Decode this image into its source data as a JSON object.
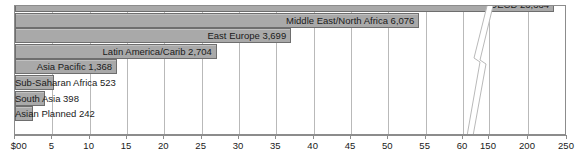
{
  "chart_data": {
    "type": "bar",
    "orientation": "horizontal",
    "title": "",
    "xlabel": "",
    "ylabel": "",
    "grid": true,
    "legend": "none",
    "axis_note": "broken x-axis: linear 0-60, then 150, 200, 250",
    "axis_ticks": [
      {
        "label": "$00",
        "value": 0
      },
      {
        "label": "5",
        "value": 5
      },
      {
        "label": "10",
        "value": 10
      },
      {
        "label": "15",
        "value": 15
      },
      {
        "label": "20",
        "value": 20
      },
      {
        "label": "25",
        "value": 25
      },
      {
        "label": "30",
        "value": 30
      },
      {
        "label": "35",
        "value": 35
      },
      {
        "label": "40",
        "value": 40
      },
      {
        "label": "45",
        "value": 45
      },
      {
        "label": "50",
        "value": 50
      },
      {
        "label": "55",
        "value": 55
      },
      {
        "label": "60",
        "value": 60
      },
      {
        "label": "150",
        "value": 150
      },
      {
        "label": "200",
        "value": 200
      },
      {
        "label": "250",
        "value": 250
      }
    ],
    "categories": [
      "OECD",
      "Middle East/North Africa",
      "East Europe",
      "Latin America/Carib",
      "Asia Pacific",
      "Sub-Saharan Africa",
      "South Asia",
      "Asian Planned"
    ],
    "values": [
      23334,
      6076,
      3699,
      2704,
      1368,
      523,
      398,
      242
    ],
    "bars": [
      {
        "label": "OECD",
        "value_text": "23,334",
        "value": 23334,
        "axis_value": 233.34
      },
      {
        "label": "Middle East/North Africa",
        "value_text": "6,076",
        "value": 6076,
        "axis_value": 60.76
      },
      {
        "label": "East Europe",
        "value_text": "3,699",
        "value": 3699,
        "axis_value": 36.99
      },
      {
        "label": "Latin America/Carib",
        "value_text": "2,704",
        "value": 2704,
        "axis_value": 27.04
      },
      {
        "label": "Asia Pacific",
        "value_text": "1,368",
        "value": 1368,
        "axis_value": 13.68
      },
      {
        "label": "Sub-Saharan Africa",
        "value_text": "523",
        "value": 523,
        "axis_value": 5.23
      },
      {
        "label": "South Asia",
        "value_text": "398",
        "value": 398,
        "axis_value": 3.98
      },
      {
        "label": "Asian Planned",
        "value_text": "242",
        "value": 242,
        "axis_value": 2.42
      }
    ],
    "colors": {
      "bar_fill": "#a9a9a9",
      "bar_border": "#6e6e6e",
      "grid": "#b9b9b9",
      "axis": "#8c8c8c",
      "text": "#1a1a1a",
      "background": "#ffffff"
    }
  }
}
